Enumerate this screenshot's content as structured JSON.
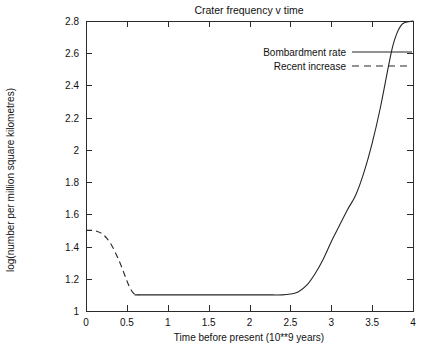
{
  "chart_data": {
    "type": "line",
    "title": "Crater frequency v time",
    "xlabel": "Time before present (10**9 years)",
    "ylabel": "log(number per million square kilometres)",
    "xlim": [
      0,
      4
    ],
    "ylim": [
      1,
      2.8
    ],
    "xticks": [
      "0",
      "0.5",
      "1",
      "1.5",
      "2",
      "2.5",
      "3",
      "3.5",
      "4"
    ],
    "xtick_values": [
      0,
      0.5,
      1,
      1.5,
      2,
      2.5,
      3,
      3.5,
      4
    ],
    "yticks": [
      "1",
      "1.2",
      "1.4",
      "1.6",
      "1.8",
      "2",
      "2.2",
      "2.4",
      "2.6",
      "2.8"
    ],
    "ytick_values": [
      1,
      1.2,
      1.4,
      1.6,
      1.8,
      2.0,
      2.2,
      2.4,
      2.6,
      2.8
    ],
    "grid": false,
    "legend_position": "top-right",
    "series": [
      {
        "name": "Bombardment rate",
        "style": "solid",
        "color": "#262626",
        "x": [
          0.6,
          0.8,
          1.0,
          1.2,
          1.4,
          1.6,
          1.8,
          2.0,
          2.2,
          2.4,
          2.5,
          2.6,
          2.7,
          2.8,
          2.9,
          3.0,
          3.1,
          3.2,
          3.3,
          3.4,
          3.5,
          3.6,
          3.7,
          3.75,
          3.8,
          3.85,
          3.9,
          4.0
        ],
        "y": [
          1.1,
          1.1,
          1.1,
          1.1,
          1.1,
          1.1,
          1.1,
          1.1,
          1.1,
          1.1,
          1.105,
          1.12,
          1.16,
          1.23,
          1.32,
          1.43,
          1.53,
          1.63,
          1.72,
          1.86,
          2.04,
          2.26,
          2.52,
          2.64,
          2.72,
          2.77,
          2.79,
          2.8
        ]
      },
      {
        "name": "Recent increase",
        "style": "dashed",
        "color": "#262626",
        "x": [
          0.0,
          0.08,
          0.14,
          0.2,
          0.26,
          0.32,
          0.38,
          0.44,
          0.5,
          0.55,
          0.6,
          0.65
        ],
        "y": [
          1.5,
          1.5,
          1.494,
          1.478,
          1.448,
          1.402,
          1.34,
          1.268,
          1.188,
          1.132,
          1.102,
          1.1
        ]
      }
    ],
    "legend": [
      {
        "label": "Bombardment rate",
        "style": "solid"
      },
      {
        "label": "Recent increase",
        "style": "dashed"
      }
    ]
  }
}
